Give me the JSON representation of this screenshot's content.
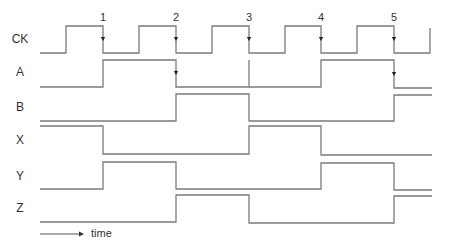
{
  "diagram": {
    "type": "timing-diagram",
    "line_color": "#7a7a7a",
    "text_color": "#333333",
    "signals": [
      {
        "name": "CK",
        "label_y": 39,
        "high_y": 26,
        "low_y": 53,
        "points": [
          [
            40,
            53
          ],
          [
            66,
            53
          ],
          [
            66,
            26
          ],
          [
            103,
            26
          ],
          [
            103,
            53
          ],
          [
            139,
            53
          ],
          [
            139,
            26
          ],
          [
            176,
            26
          ],
          [
            176,
            53
          ],
          [
            212,
            53
          ],
          [
            212,
            26
          ],
          [
            249,
            26
          ],
          [
            249,
            53
          ],
          [
            285,
            53
          ],
          [
            285,
            26
          ],
          [
            321,
            26
          ],
          [
            321,
            53
          ],
          [
            357,
            53
          ],
          [
            357,
            26
          ],
          [
            394,
            26
          ],
          [
            394,
            53
          ],
          [
            430,
            53
          ],
          [
            430,
            28
          ]
        ]
      },
      {
        "name": "A",
        "label_y": 72,
        "high_y": 60,
        "low_y": 87,
        "points": [
          [
            40,
            87
          ],
          [
            103,
            87
          ],
          [
            103,
            60
          ],
          [
            176,
            60
          ],
          [
            176,
            87
          ],
          [
            321,
            87
          ],
          [
            321,
            60
          ],
          [
            394,
            60
          ],
          [
            394,
            88
          ],
          [
            432,
            88
          ]
        ],
        "extra_segments": [
          [
            [
              249,
              60
            ],
            [
              249,
              87
            ]
          ]
        ]
      },
      {
        "name": "B",
        "label_y": 107,
        "high_y": 94,
        "low_y": 121,
        "points": [
          [
            40,
            121
          ],
          [
            176,
            121
          ],
          [
            176,
            94
          ],
          [
            249,
            94
          ],
          [
            249,
            121
          ],
          [
            394,
            121
          ],
          [
            394,
            95
          ],
          [
            432,
            95
          ]
        ]
      },
      {
        "name": "X",
        "label_y": 140,
        "high_y": 126,
        "low_y": 154,
        "points": [
          [
            40,
            126
          ],
          [
            103,
            126
          ],
          [
            103,
            154
          ],
          [
            249,
            154
          ],
          [
            249,
            126
          ],
          [
            321,
            126
          ],
          [
            321,
            155
          ],
          [
            432,
            155
          ]
        ]
      },
      {
        "name": "Y",
        "label_y": 176,
        "high_y": 162,
        "low_y": 189,
        "points": [
          [
            40,
            189
          ],
          [
            103,
            189
          ],
          [
            103,
            162
          ],
          [
            176,
            162
          ],
          [
            176,
            189
          ],
          [
            321,
            189
          ],
          [
            321,
            163
          ],
          [
            394,
            163
          ],
          [
            394,
            190
          ],
          [
            432,
            190
          ]
        ]
      },
      {
        "name": "Z",
        "label_y": 208,
        "high_y": 195,
        "low_y": 222,
        "points": [
          [
            40,
            222
          ],
          [
            176,
            222
          ],
          [
            176,
            195
          ],
          [
            249,
            195
          ],
          [
            249,
            223
          ],
          [
            394,
            223
          ],
          [
            394,
            196
          ],
          [
            432,
            196
          ]
        ]
      }
    ],
    "clock_edges": [
      {
        "label": "1",
        "x": 103
      },
      {
        "label": "2",
        "x": 176
      },
      {
        "label": "3",
        "x": 249
      },
      {
        "label": "4",
        "x": 321
      },
      {
        "label": "5",
        "x": 394
      }
    ],
    "edge_arrows": [
      {
        "x": 103,
        "y": 39
      },
      {
        "x": 176,
        "y": 39
      },
      {
        "x": 249,
        "y": 39
      },
      {
        "x": 321,
        "y": 39
      },
      {
        "x": 394,
        "y": 39
      },
      {
        "x": 176,
        "y": 73
      },
      {
        "x": 394,
        "y": 74
      }
    ],
    "time_axis": {
      "label": "time",
      "x1": 40,
      "x2": 84,
      "y": 234
    }
  }
}
